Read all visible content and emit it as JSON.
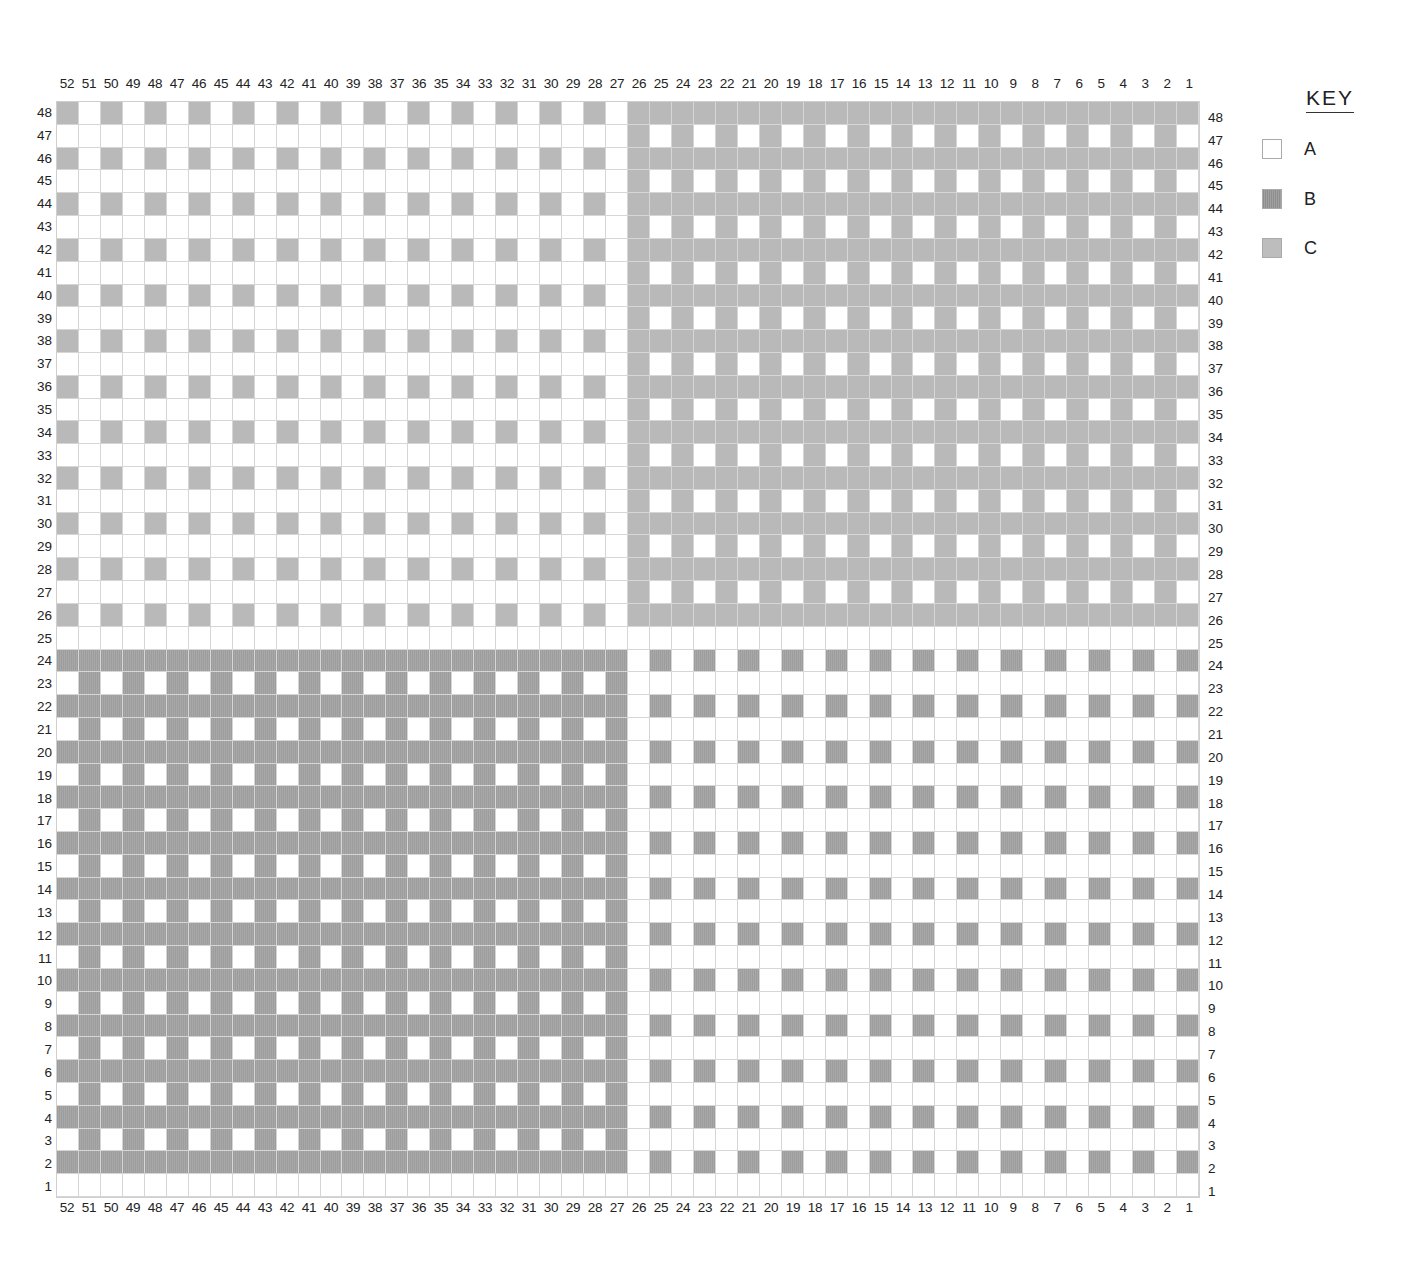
{
  "key": {
    "title": "KEY",
    "items": [
      {
        "code": "A",
        "label": "A",
        "color": "#ffffff"
      },
      {
        "code": "B",
        "label": "B",
        "color": "#9d9d9d"
      },
      {
        "code": "C",
        "label": "C",
        "color": "#b9b9b9"
      }
    ]
  },
  "chart_data": {
    "type": "table",
    "columns": 52,
    "rows": 48,
    "column_labels": [
      "52",
      "51",
      "50",
      "49",
      "48",
      "47",
      "46",
      "45",
      "44",
      "43",
      "42",
      "41",
      "40",
      "39",
      "38",
      "37",
      "36",
      "35",
      "34",
      "33",
      "32",
      "31",
      "30",
      "29",
      "28",
      "27",
      "26",
      "25",
      "24",
      "23",
      "22",
      "21",
      "20",
      "19",
      "18",
      "17",
      "16",
      "15",
      "14",
      "13",
      "12",
      "11",
      "10",
      "9",
      "8",
      "7",
      "6",
      "5",
      "4",
      "3",
      "2",
      "1"
    ],
    "row_labels": [
      "48",
      "47",
      "46",
      "45",
      "44",
      "43",
      "42",
      "41",
      "40",
      "39",
      "38",
      "37",
      "36",
      "35",
      "34",
      "33",
      "32",
      "31",
      "30",
      "29",
      "28",
      "27",
      "26",
      "25",
      "24",
      "23",
      "22",
      "21",
      "20",
      "19",
      "18",
      "17",
      "16",
      "15",
      "14",
      "13",
      "12",
      "11",
      "10",
      "9",
      "8",
      "7",
      "6",
      "5",
      "4",
      "3",
      "2",
      "1"
    ],
    "legend": {
      "A": "white",
      "B": "dark grey",
      "C": "light grey"
    },
    "grid_rows_top_to_bottom": [
      "CACACACACACACACACACACACACACCCCCCCCCCCCCCCCCCCCCCCCCC",
      "AAAAAAAAAAAAAAAAAAAAAAAAAACACACACACACACACACACACACACA",
      "CACACACACACACACACACACACACACCCCCCCCCCCCCCCCCCCCCCCCCC",
      "AAAAAAAAAAAAAAAAAAAAAAAAAACACACACACACACACACACACACACA",
      "CACACACACACACACACACACACACACCCCCCCCCCCCCCCCCCCCCCCCCC",
      "AAAAAAAAAAAAAAAAAAAAAAAAAACACACACACACACACACACACACACA",
      "CACACACACACACACACACACACACACCCCCCCCCCCCCCCCCCCCCCCCCC",
      "AAAAAAAAAAAAAAAAAAAAAAAAAACACACACACACACACACACACACACA",
      "CACACACACACACACACACACACACACCCCCCCCCCCCCCCCCCCCCCCCCC",
      "AAAAAAAAAAAAAAAAAAAAAAAAAACACACACACACACACACACACACACA",
      "CACACACACACACACACACACACACACCCCCCCCCCCCCCCCCCCCCCCCCC",
      "AAAAAAAAAAAAAAAAAAAAAAAAAACACACACACACACACACACACACACA",
      "CACACACACACACACACACACACACACCCCCCCCCCCCCCCCCCCCCCCCCC",
      "AAAAAAAAAAAAAAAAAAAAAAAAAACACACACACACACACACACACACACA",
      "CACACACACACACACACACACACACACCCCCCCCCCCCCCCCCCCCCCCCCC",
      "AAAAAAAAAAAAAAAAAAAAAAAAAACACACACACACACACACACACACACA",
      "CACACACACACACACACACACACACACCCCCCCCCCCCCCCCCCCCCCCCCC",
      "AAAAAAAAAAAAAAAAAAAAAAAAAACACACACACACACACACACACACACA",
      "CACACACACACACACACACACACACACCCCCCCCCCCCCCCCCCCCCCCCCC",
      "AAAAAAAAAAAAAAAAAAAAAAAAAACACACACACACACACACACACACACA",
      "CACACACACACACACACACACACACACCCCCCCCCCCCCCCCCCCCCCCCCC",
      "AAAAAAAAAAAAAAAAAAAAAAAAAACACACACACACACACACACACACACA",
      "CACACACACACACACACACACACACACCCCCCCCCCCCCCCCCCCCCCCCCC",
      "AAAAAAAAAAAAAAAAAAAAAAAAAAAAAAAAAAAAAAAAAAAAAAAAAAAA",
      "BBBBBBBBBBBBBBBBBBBBBBBBBBABABABABABABABABABABABABAB",
      "ABABABABABABABABABABABABABAAAAAAAAAAAAAAAAAAAAAAAAAA",
      "BBBBBBBBBBBBBBBBBBBBBBBBBBABABABABABABABABABABABABAB",
      "ABABABABABABABABABABABABABAAAAAAAAAAAAAAAAAAAAAAAAAA",
      "BBBBBBBBBBBBBBBBBBBBBBBBBBABABABABABABABABABABABABAB",
      "ABABABABABABABABABABABABABAAAAAAAAAAAAAAAAAAAAAAAAAA",
      "BBBBBBBBBBBBBBBBBBBBBBBBBBABABABABABABABABABABABABAB",
      "ABABABABABABABABABABABABABAAAAAAAAAAAAAAAAAAAAAAAAAA",
      "BBBBBBBBBBBBBBBBBBBBBBBBBBABABABABABABABABABABABABAB",
      "ABABABABABABABABABABABABABAAAAAAAAAAAAAAAAAAAAAAAAAA",
      "BBBBBBBBBBBBBBBBBBBBBBBBBBABABABABABABABABABABABABAB",
      "ABABABABABABABABABABABABABAAAAAAAAAAAAAAAAAAAAAAAAAA",
      "BBBBBBBBBBBBBBBBBBBBBBBBBBABABABABABABABABABABABABAB",
      "ABABABABABABABABABABABABABAAAAAAAAAAAAAAAAAAAAAAAAAA",
      "BBBBBBBBBBBBBBBBBBBBBBBBBBABABABABABABABABABABABABAB",
      "ABABABABABABABABABABABABABAAAAAAAAAAAAAAAAAAAAAAAAAA",
      "BBBBBBBBBBBBBBBBBBBBBBBBBBABABABABABABABABABABABABAB",
      "ABABABABABABABABABABABABABAAAAAAAAAAAAAAAAAAAAAAAAAA",
      "BBBBBBBBBBBBBBBBBBBBBBBBBBABABABABABABABABABABABABAB",
      "ABABABABABABABABABABABABABAAAAAAAAAAAAAAAAAAAAAAAAAA",
      "BBBBBBBBBBBBBBBBBBBBBBBBBBABABABABABABABABABABABABAB",
      "ABABABABABABABABABABABABABAAAAAAAAAAAAAAAAAAAAAAAAAA",
      "BBBBBBBBBBBBBBBBBBBBBBBBBBABABABABABABABABABABABABAB",
      "AAAAAAAAAAAAAAAAAAAAAAAAAAAAAAAAAAAAAAAAAAAAAAAAAAAA"
    ]
  }
}
